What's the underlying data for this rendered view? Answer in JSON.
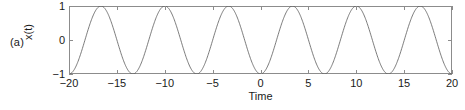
{
  "panel": {
    "label": "(a)"
  },
  "chart_data": {
    "type": "line",
    "title": "",
    "xlabel": "Time",
    "ylabel": "x(t)",
    "xlim": [
      -20,
      20
    ],
    "ylim": [
      -1,
      1
    ],
    "xticks": [
      -20,
      -15,
      -10,
      -5,
      0,
      5,
      10,
      15,
      20
    ],
    "xtick_labels": [
      "−20",
      "−15",
      "−10",
      "−5",
      "0",
      "5",
      "10",
      "15",
      "20"
    ],
    "yticks": [
      -1,
      0,
      1
    ],
    "ytick_labels": [
      "−1",
      "0",
      "1"
    ],
    "grid": false,
    "legend": null,
    "line_color": "#5a5a5a",
    "line_width": 0.8,
    "series": [
      {
        "name": "x(t)",
        "description": "sinusoid, amplitude 1, period 6.67, starts at minimum at t=-20",
        "amplitude": 1.0,
        "period": 6.67,
        "frequency": 0.15,
        "phase_offset_time": -20,
        "waveform": "negative-cosine",
        "peak_times": [
          -17.33,
          -10.67,
          -4.0,
          2.67,
          9.33,
          16.0
        ],
        "trough_times": [
          -20.0,
          -13.33,
          -6.67,
          0.0,
          6.67,
          13.33,
          20.0
        ],
        "samples_per_unit": 20
      }
    ]
  }
}
